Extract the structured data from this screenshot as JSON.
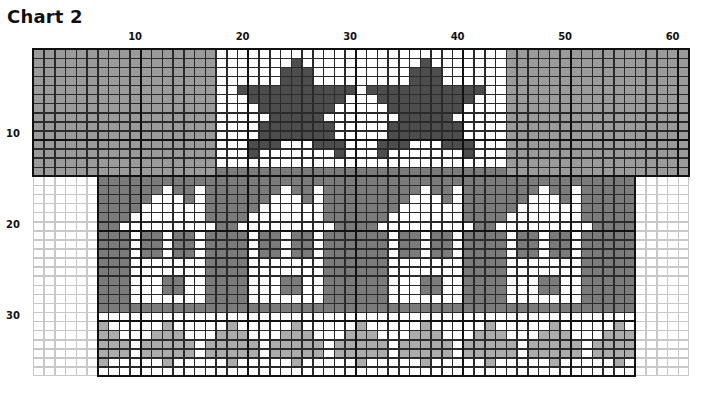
{
  "title": "Chart 2",
  "chart_data": {
    "type": "table",
    "title": "Chart 2",
    "columns": 61,
    "rows": 36,
    "column_tick_labels": [
      {
        "label": "10",
        "col": 10
      },
      {
        "label": "20",
        "col": 20
      },
      {
        "label": "30",
        "col": 30
      },
      {
        "label": "40",
        "col": 40
      },
      {
        "label": "50",
        "col": 50
      },
      {
        "label": "60",
        "col": 60
      }
    ],
    "row_tick_labels": [
      {
        "label": "10",
        "row": 10
      },
      {
        "label": "20",
        "row": 20
      },
      {
        "label": "30",
        "row": 30
      }
    ],
    "legend": {
      "G": {
        "name": "background gray",
        "color": "#9b9b9b"
      },
      "W": {
        "name": "white",
        "color": "#ffffff"
      },
      "D": {
        "name": "star dark gray",
        "color": "#4d4d4d"
      },
      "H": {
        "name": "house background gray",
        "color": "#7b7b7b"
      },
      "L": {
        "name": "tree light gray",
        "color": "#acacac"
      },
      ".": {
        "name": "empty (outside chart)",
        "color": "#ffffff"
      }
    },
    "blocks": [
      {
        "name": "top-band",
        "col_start": 0,
        "col_end": 61,
        "row_start": 0,
        "row_end": 14
      },
      {
        "name": "bottom-band",
        "col_start": 6,
        "col_end": 56,
        "row_start": 14,
        "row_end": 36
      }
    ],
    "grid": [
      "GGGGGGGGGGGGGGGGGWWWWWWWWWWWWWWWWWWWWWWWWWWWGGGGGGGGGGGGGGGGG",
      "GGGGGGGGGGGGGGGGGWWWWWWWDWWWWWWWWWWWDWWWWWWWGGGGGGGGGGGGGGGGG",
      "GGGGGGGGGGGGGGGGGWWWWWWDDDWWWWWWWWWDDDWWWWWWGGGGGGGGGGGGGGGGG",
      "GGGGGGGGGGGGGGGGGWWWWWWDDDWWWWWWWWWDDDWWWWWWGGGGGGGGGGGGGGGGG",
      "GGGGGGGGGGGGGGGGGWWDDDDDDDDDDDWDDDDDDDDDDDWWGGGGGGGGGGGGGGGGG",
      "GGGGGGGGGGGGGGGGGWWWDDDDDDDDDWWWDDDDDDDDDWWWGGGGGGGGGGGGGGGGG",
      "GGGGGGGGGGGGGGGGGWWWWDDDDDDDWWWWWDDDDDDDWWWWGGGGGGGGGGGGGGGGG",
      "GGGGGGGGGGGGGGGGGWWWWWDDDDDWWWWWWWDDDDDWWWWWGGGGGGGGGGGGGGGGG",
      "GGGGGGGGGGGGGGGGGWWWWDDDDDDDWWWWWDDDDDDDWWWWGGGGGGGGGGGGGGGGG",
      "GGGGGGGGGGGGGGGGGWWWWDDDDDDDWWWWWDDDDDDDWWWWGGGGGGGGGGGGGGGGG",
      "GGGGGGGGGGGGGGGGGWWWDDDWWWDDDWWWDDDWWWDDDWWWGGGGGGGGGGGGGGGGG",
      "GGGGGGGGGGGGGGGGGWWWDWWWWWWWDWWWDWWWWWWWDWWWGGGGGGGGGGGGGGGGG",
      "GGGGGGGGGGGGGGGGGWWWWWWWWWWWWWWWWWWWWWWWWWWWGGGGGGGGGGGGGGGGG",
      "GGGGGGGGGGGGGGGGGHHHHHHHHHHHHHHHHHHHHHHHHHHHGGGGGGGGGGGGGGGGG",
      "......HHHHHHHHHHHHHHHHHHHHHHHHHHHHHHHHHHHHHHHHHHHHHHHHHH.....",
      "......HHHHHHWHHWHHHHHHHWHHWHHHHHHHHHWHHWHHHHHHHWHHWHHHHH.....",
      "......HHHHHWWWHWHHHHHHWWWHWHHHHHHHHWWWHWHHHHHHWWWHWHHHHH.....",
      "......HHHHWWWWWWHHHHHWWWWWWHHHHHHHWWWWWWHHHHHWWWWWWHHHHH.....",
      "......HHHWWWWWWWHHHHWWWWWWWHHHHHHWWWWWWWHHHHWWWWWWWHHHHH.....",
      "......HHWWWWWWWWWHHWWWWWWWWWHHHHWWWWWWWWWHHWWWWWWWWWHHHH.....",
      "......HHHWHHWHHWHHHHWHHWHHWHHHHHHWHHWHHWHHHHWHHWHHWHHHHH.....",
      "......HHHWHHWHHWHHHHWHHWHHWHHHHHHWHHWHHWHHHHWHHWHHWHHHHH.....",
      "......HHHWHHWHHWHHHHWHHWHHWHHHHHHWHHWHHWHHHHWHHWHHWHHHHH.....",
      "......HHHWWWWWWWHHHHWWWWWWWHHHHHHWWWWWWWHHHHWWWWWWWHHHHH.....",
      "......HHHWWWWWWWHHHHWWWWWWWHHHHHHWWWWWWWHHHHWWWWWWWHHHHH.....",
      "......HHHWWWHHWWHHHHWWWHHWWHHHHHHWWWHHWWHHHHWWWHHWWHHHHH.....",
      "......HHHWWWHHWWHHHHWWWHHWWHHHHHHWWWHHWWHHHHWWWHHWWHHHHH.....",
      "......HHHWWWWWWWHHHHWWWWWWWHHHHHHWWWWWWWHHHHWWWWWWWHHHHH.....",
      "......HHHHHHHHHHHHHHHHHHHHHHHHHHHHHHHHHHHHHHHHHHHHHHHHHH.....",
      "......WWWWWWWWWWWWWWWWWWWWWWWWWWWWWWWWWWWWWWWWWWWWWWWWWW.....",
      "......LWWWWWLWWWWWLWWWWWLWWWWWLWWWWWLWWWWWLWWWWWLWWWWWLW.....",
      "......LLWWWLLLWWWLLLWWWLLLWWWLLLWWWLLLWWWLLLWWWLLLWWWLLL.....",
      "......LLLWLLLLLWLLLLLWLLLLLWLLLLLWLLLLLWLLLLLWLLLLLWLLLL.....",
      "......LLLWLLLLLWLLLLLWLLLLLWLLLLLWLLLLLWLLLLLWLLLLLWLLLL.....",
      "......LWWWWWLWWWWWLWWWWWLWWWWWLWWWWWLWWWWWLWWWWWLWWWWWLW.....",
      "......WWWWWWWWWWWWWWWWWWWWWWWWWWWWWWWWWWWWWWWWWWWWWWWWWW....."
    ]
  }
}
